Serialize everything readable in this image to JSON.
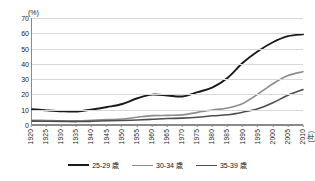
{
  "chart_data": {
    "type": "line",
    "title": "",
    "subtitle": "",
    "xlabel": "(年)",
    "ylabel": "(%)",
    "unit_label_y": "(%)",
    "unit_label_x": "(年)",
    "grid": true,
    "legend_position": "bottom",
    "ylim": [
      0,
      70
    ],
    "ytick_step": 10,
    "yticks": [
      0,
      10,
      20,
      30,
      40,
      50,
      60,
      70
    ],
    "categories": [
      "1920",
      "1925",
      "1930",
      "1935",
      "1940",
      "1945",
      "1950",
      "1955",
      "1960",
      "1965",
      "1970",
      "1975",
      "1980",
      "1985",
      "1990",
      "1995",
      "2000",
      "2005",
      "2010"
    ],
    "x": [
      1920,
      1925,
      1930,
      1935,
      1940,
      1945,
      1950,
      1955,
      1960,
      1965,
      1970,
      1975,
      1980,
      1985,
      1990,
      1995,
      2000,
      2005,
      2010
    ],
    "series": [
      {
        "name": "25-29 歳",
        "color": "#1a1a1a",
        "width": 1.9,
        "values": [
          9.9,
          9.2,
          8.5,
          8.3,
          9.5,
          11.0,
          13.0,
          16.8,
          19.2,
          18.7,
          18.1,
          20.9,
          24.0,
          28.1,
          32.6,
          37.3,
          42.9,
          47.1,
          47.3
        ]
      },
      {
        "name": "30-34 歳",
        "color": "#8c8c8c",
        "width": 1.6,
        "values": [
          2.4,
          2.2,
          2.0,
          2.0,
          2.4,
          2.8,
          3.2,
          4.4,
          5.4,
          5.6,
          5.9,
          7.6,
          9.1,
          10.4,
          13.3,
          16.4,
          20.3,
          26.6,
          34.5
        ]
      },
      {
        "name": "35-39 歳",
        "color": "#4d4d4d",
        "width": 1.6,
        "values": [
          1.8,
          1.7,
          1.6,
          1.5,
          1.7,
          2.0,
          2.2,
          2.5,
          3.0,
          3.5,
          3.8,
          4.4,
          5.3,
          6.0,
          7.5,
          9.1,
          12.0,
          17.2,
          22.8
        ]
      }
    ],
    "series_plotted": [
      {
        "name": "25-29 歳",
        "color": "#1a1a1a",
        "width": 1.9,
        "values": [
          9.8,
          9.0,
          8.4,
          8.3,
          9.6,
          11.2,
          13.2,
          17.0,
          19.4,
          18.8,
          18.2,
          21.0,
          24.2,
          30.6,
          40.4,
          48.0,
          54.0,
          58.0,
          59.2
        ]
      },
      {
        "name": "30-34 歳",
        "color": "#8c8c8c",
        "width": 1.6,
        "values": [
          2.5,
          2.3,
          2.1,
          2.1,
          2.5,
          2.9,
          3.3,
          4.5,
          5.5,
          5.7,
          6.0,
          7.7,
          9.2,
          10.6,
          13.6,
          19.7,
          26.6,
          32.0,
          34.5
        ]
      },
      {
        "name": "35-39 歳",
        "color": "#4d4d4d",
        "width": 1.6,
        "values": [
          1.9,
          1.8,
          1.7,
          1.6,
          1.8,
          2.1,
          2.3,
          2.6,
          3.1,
          3.6,
          3.9,
          4.5,
          5.4,
          6.1,
          7.8,
          10.0,
          14.0,
          19.0,
          22.8
        ]
      }
    ]
  },
  "legend": {
    "items": [
      {
        "label": "25-29 歳",
        "color": "#1a1a1a"
      },
      {
        "label": "30-34 歳",
        "color": "#8c8c8c"
      },
      {
        "label": "35-39 歳",
        "color": "#4d4d4d"
      }
    ]
  }
}
